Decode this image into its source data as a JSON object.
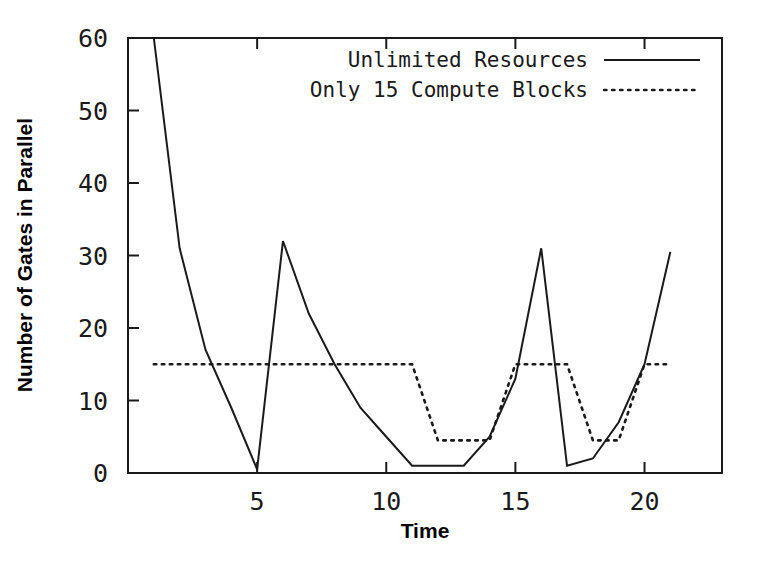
{
  "chart_data": {
    "type": "line",
    "title": "",
    "xlabel": "Time",
    "ylabel": "Number of Gates in Parallel",
    "xlim": [
      0,
      23
    ],
    "ylim": [
      0,
      60
    ],
    "grid": false,
    "legend_position": "top-right",
    "xticks": [
      5,
      10,
      15,
      20
    ],
    "yticks": [
      0,
      10,
      20,
      30,
      40,
      50,
      60
    ],
    "xtick_labels": [
      "5",
      "10",
      "15",
      "20"
    ],
    "ytick_labels": [
      "0",
      "10",
      "20",
      "30",
      "40",
      "50",
      "60"
    ],
    "series": [
      {
        "name": "Unlimited Resources",
        "style": "solid",
        "color": "#1a1a1a",
        "x": [
          1,
          2,
          3,
          4,
          5,
          6,
          7,
          8,
          9,
          10,
          11,
          12,
          13,
          14,
          15,
          16,
          17,
          18,
          19,
          20,
          21
        ],
        "values": [
          60,
          31,
          17,
          9,
          0.5,
          32,
          22,
          15,
          9,
          5,
          1,
          1,
          1,
          5,
          13,
          31,
          1,
          2,
          7,
          15,
          30.5
        ]
      },
      {
        "name": "Only 15 Compute Blocks",
        "style": "dotted",
        "color": "#1a1a1a",
        "x": [
          1,
          2,
          3,
          4,
          5,
          6,
          7,
          8,
          9,
          10,
          11,
          12,
          13,
          14,
          15,
          16,
          17,
          18,
          19,
          20,
          21
        ],
        "values": [
          15,
          15,
          15,
          15,
          15,
          15,
          15,
          15,
          15,
          15,
          15,
          4.5,
          4.5,
          4.5,
          15,
          15,
          15,
          4.5,
          4.5,
          15,
          15
        ]
      }
    ]
  },
  "legend": {
    "entries": [
      {
        "label": "Unlimited Resources",
        "style": "solid"
      },
      {
        "label": "Only 15 Compute Blocks",
        "style": "dotted"
      }
    ]
  },
  "axes": {
    "x_title": "Time",
    "y_title": "Number of Gates in Parallel",
    "x_tick_labels": [
      "5",
      "10",
      "15",
      "20"
    ],
    "y_tick_labels": [
      "60",
      "50",
      "40",
      "30",
      "20",
      "10",
      "0"
    ]
  }
}
